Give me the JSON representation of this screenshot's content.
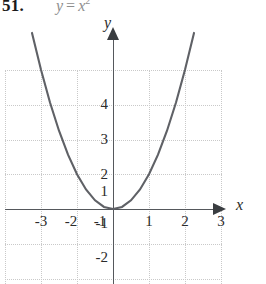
{
  "problem": {
    "number": "51.",
    "equation_lhs": "y",
    "equation_op": "=",
    "equation_rhs_base": "x",
    "equation_rhs_exponent": "2",
    "equation_full": "y = x²"
  },
  "axes": {
    "x_label": "x",
    "y_label": "y",
    "x_ticks": [
      "-3",
      "-2",
      "-1",
      "1",
      "2",
      "3"
    ],
    "y_ticks": [
      "4",
      "3",
      "2",
      "1",
      "-1",
      "-2"
    ]
  },
  "colors": {
    "curve": "#5f6166",
    "axis": "#55585c",
    "grid": "#c9c9c9",
    "text": "#2b2b2b",
    "equation_text": "#8e8e8e",
    "background": "#ffffff"
  },
  "chart_data": {
    "type": "line",
    "xlabel": "x",
    "ylabel": "y",
    "xlim": [
      -3.2,
      3.2
    ],
    "ylim": [
      -2.6,
      5.2
    ],
    "grid": true,
    "legend": "none",
    "xticks": [
      -3,
      -2,
      -1,
      1,
      2,
      3
    ],
    "yticks": [
      -2,
      -1,
      1,
      2,
      3,
      4
    ],
    "series": [
      {
        "name": "y = x^2",
        "x": [
          -2.25,
          -2.0,
          -1.75,
          -1.5,
          -1.25,
          -1.0,
          -0.75,
          -0.5,
          -0.25,
          0,
          0.25,
          0.5,
          0.75,
          1.0,
          1.25,
          1.5,
          1.75,
          2.0,
          2.25
        ],
        "values": [
          5.06,
          4.0,
          3.06,
          2.25,
          1.56,
          1.0,
          0.56,
          0.25,
          0.06,
          0,
          0.06,
          0.25,
          0.56,
          1.0,
          1.56,
          2.25,
          3.06,
          4.0,
          5.06
        ]
      }
    ]
  }
}
